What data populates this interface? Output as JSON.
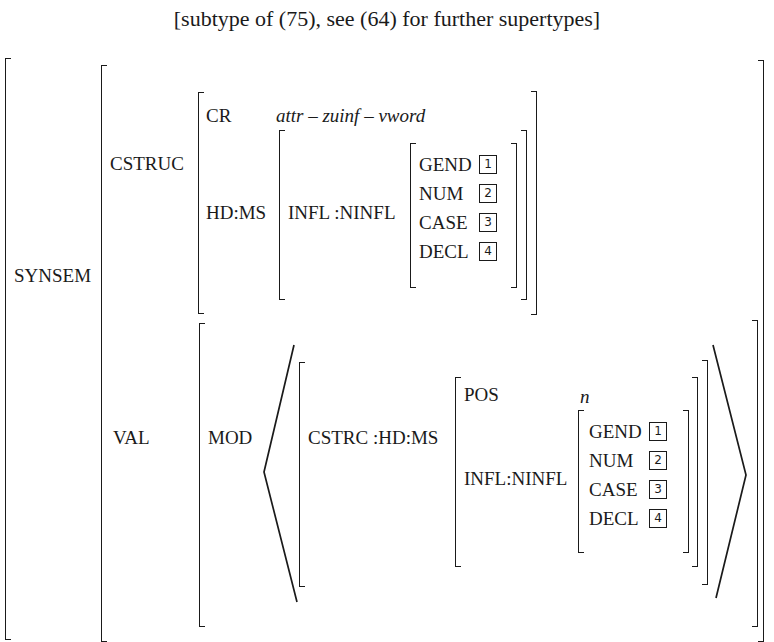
{
  "title": "[subtype of (75), see (64) for further supertypes]",
  "avm": {
    "synsem": {
      "label": "SYNSEM",
      "cstruc": {
        "label": "CSTRUC",
        "cr": {
          "label": "CR",
          "value": "attr – zuinf – vword"
        },
        "hd_ms": {
          "label": "HD:MS",
          "infl": {
            "label": "INFL :NINFL",
            "features": [
              {
                "label": "GEND",
                "tag": "1"
              },
              {
                "label": "NUM",
                "tag": "2"
              },
              {
                "label": "CASE",
                "tag": "3"
              },
              {
                "label": "DECL",
                "tag": "4"
              }
            ]
          }
        }
      },
      "val": {
        "label": "VAL",
        "mod": {
          "label": "MOD",
          "cstrc": {
            "label": "CSTRC :HD:MS",
            "pos": {
              "label": "POS",
              "value": "n"
            },
            "infl": {
              "label": "INFL:NINFL",
              "features": [
                {
                  "label": "GEND",
                  "tag": "1"
                },
                {
                  "label": "NUM",
                  "tag": "2"
                },
                {
                  "label": "CASE",
                  "tag": "3"
                },
                {
                  "label": "DECL",
                  "tag": "4"
                }
              ]
            }
          }
        }
      }
    }
  }
}
